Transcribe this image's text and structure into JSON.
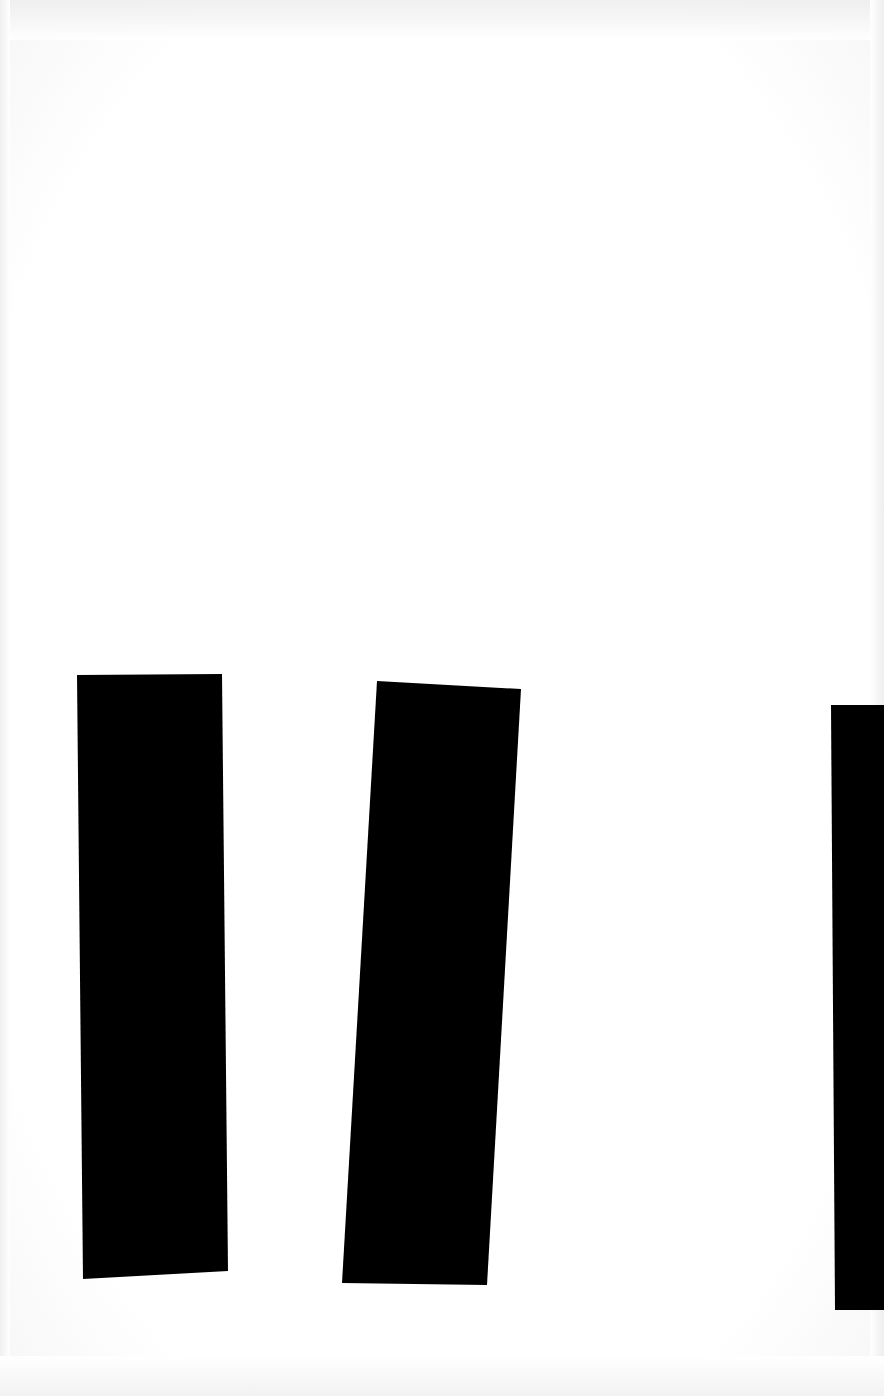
{
  "scene": {
    "description": "Scanned white paper with three thick black vertical bars",
    "background_color": "#ffffff",
    "bar_color": "#000000"
  },
  "bars": [
    {
      "id": "bar-1",
      "points": "77,675 222,674 228,1271 83,1279"
    },
    {
      "id": "bar-2",
      "points": "377,681 521,689 487,1285 342,1283"
    },
    {
      "id": "bar-3",
      "points": "831,705 884,705 884,1310 835,1310",
      "clipped_right": true
    }
  ]
}
